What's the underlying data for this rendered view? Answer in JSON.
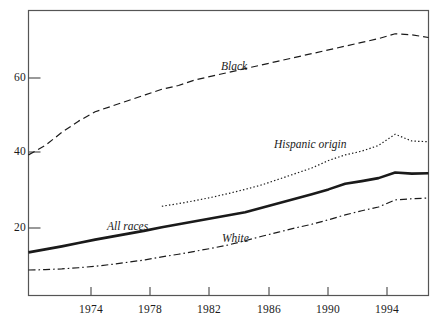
{
  "chart_data": {
    "type": "line",
    "title": "",
    "subtitle": "",
    "xlabel": "",
    "ylabel": "",
    "xlim": [
      1972,
      1996
    ],
    "ylim": [
      0,
      76
    ],
    "grid": false,
    "legend_position": "inline-labels",
    "x_ticks": [
      1974,
      1978,
      1982,
      1986,
      1990,
      1994
    ],
    "x_tick_labels": [
      "1974",
      "1978",
      "1982",
      "1986",
      "1990",
      "1994"
    ],
    "y_ticks": [
      20,
      40,
      60
    ],
    "y_tick_labels": [
      "20",
      "40",
      "60"
    ],
    "series": [
      {
        "name": "Black",
        "style": "dashed",
        "color": "#1a1a1a",
        "label": "Black",
        "x": [
          1972,
          1973,
          1974,
          1975,
          1976,
          1977,
          1978,
          1979,
          1980,
          1981,
          1982,
          1983,
          1984,
          1985,
          1986,
          1987,
          1988,
          1989,
          1990,
          1991,
          1992,
          1993,
          1994,
          1995,
          1996
        ],
        "values": [
          37.5,
          40.0,
          43.5,
          46.5,
          49.0,
          50.5,
          52.0,
          53.5,
          55.0,
          56.0,
          57.5,
          58.5,
          59.5,
          60.5,
          61.5,
          62.5,
          63.5,
          64.5,
          65.5,
          66.5,
          67.5,
          68.5,
          69.8,
          69.5,
          68.8
        ]
      },
      {
        "name": "Hispanic origin",
        "style": "dotted",
        "color": "#1a1a1a",
        "label": "Hispanic origin",
        "x": [
          1980,
          1981,
          1982,
          1983,
          1984,
          1985,
          1986,
          1987,
          1988,
          1989,
          1990,
          1991,
          1992,
          1993,
          1994,
          1995,
          1996
        ],
        "values": [
          23.8,
          24.5,
          25.3,
          26.2,
          27.2,
          28.3,
          29.5,
          31.0,
          32.5,
          34.0,
          36.0,
          37.5,
          38.5,
          40.0,
          43.0,
          41.2,
          41.0
        ]
      },
      {
        "name": "All races",
        "style": "solid-thick",
        "color": "#1a1a1a",
        "label": "All races",
        "x": [
          1972,
          1973,
          1974,
          1975,
          1976,
          1977,
          1978,
          1979,
          1980,
          1981,
          1982,
          1983,
          1984,
          1985,
          1986,
          1987,
          1988,
          1989,
          1990,
          1991,
          1992,
          1993,
          1994,
          1995,
          1996
        ],
        "values": [
          11.5,
          12.3,
          13.1,
          14.0,
          14.9,
          15.7,
          16.5,
          17.3,
          18.2,
          19.0,
          19.8,
          20.6,
          21.4,
          22.2,
          23.4,
          24.6,
          25.8,
          27.0,
          28.3,
          29.8,
          30.5,
          31.3,
          32.8,
          32.5,
          32.6
        ]
      },
      {
        "name": "White",
        "style": "dash-dot",
        "color": "#1a1a1a",
        "label": "White",
        "x": [
          1972,
          1973,
          1974,
          1975,
          1976,
          1977,
          1978,
          1979,
          1980,
          1981,
          1982,
          1983,
          1984,
          1985,
          1986,
          1987,
          1988,
          1989,
          1990,
          1991,
          1992,
          1993,
          1994,
          1995,
          1996
        ],
        "values": [
          6.8,
          6.9,
          7.1,
          7.4,
          7.8,
          8.3,
          8.9,
          9.5,
          10.3,
          11.0,
          11.8,
          12.6,
          13.5,
          14.6,
          15.8,
          16.9,
          18.0,
          19.0,
          20.2,
          21.5,
          22.6,
          23.6,
          25.5,
          25.8,
          26.0
        ]
      }
    ]
  },
  "axes": {
    "y_labels": [
      "60",
      "40",
      "20"
    ],
    "x_labels": [
      "1974",
      "1978",
      "1982",
      "1986",
      "1990",
      "1994"
    ]
  },
  "labels": {
    "black": "Black",
    "hispanic": "Hispanic origin",
    "all_races": "All races",
    "white": "White"
  },
  "colors": {
    "line": "#1a1a1a",
    "axis": "#4a4a4a",
    "background": "#ffffff"
  }
}
